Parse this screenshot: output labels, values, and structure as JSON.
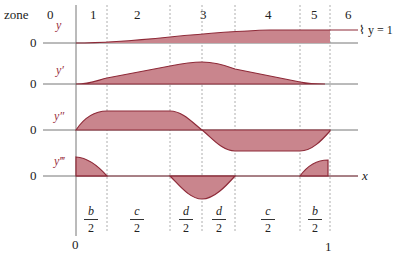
{
  "header": {
    "zone_label": "zone",
    "zones": [
      "0",
      "1",
      "2",
      "3",
      "4",
      "5",
      "6"
    ]
  },
  "rows": [
    {
      "name": "y",
      "zero": "0"
    },
    {
      "name": "y′",
      "zero": "0"
    },
    {
      "name": "y″",
      "zero": "0"
    },
    {
      "name": "y‴",
      "zero": "0"
    }
  ],
  "annotations": {
    "y_equals_one": "⌇ y = 1",
    "x_axis": "x",
    "x_start": "0",
    "x_end": "1"
  },
  "intervals": [
    {
      "num": "b",
      "den": "2"
    },
    {
      "num": "c",
      "den": "2"
    },
    {
      "num": "d",
      "den": "2"
    },
    {
      "num": "d",
      "den": "2"
    },
    {
      "num": "c",
      "den": "2"
    },
    {
      "num": "b",
      "den": "2"
    }
  ],
  "colors": {
    "fill": "#c9858d",
    "stroke": "#8e2a38",
    "axis": "#777777"
  }
}
